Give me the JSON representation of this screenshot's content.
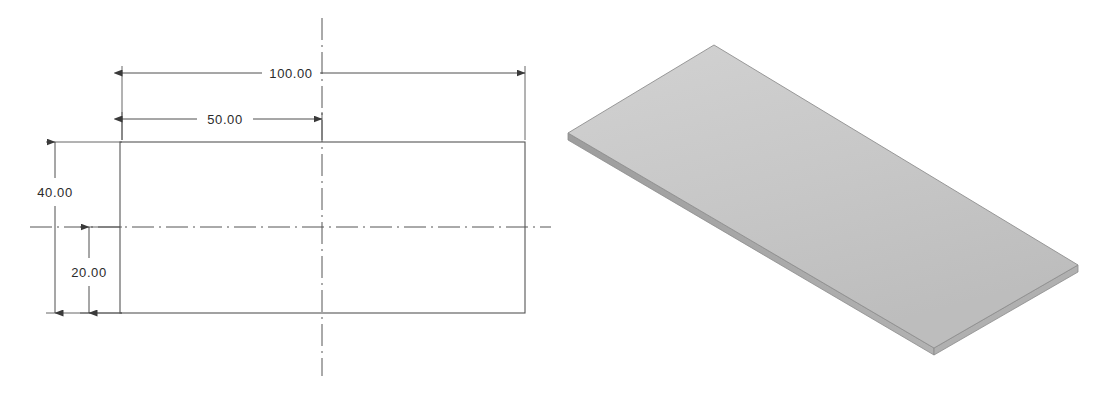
{
  "drawing": {
    "type": "engineering-drawing",
    "style": "solidworks-2d-orthographic-with-isometric",
    "background_color": "#ffffff",
    "line_color": "#4a4a4a",
    "text_color": "#2b2b2b"
  },
  "views": {
    "front_view": {
      "name": "front-view",
      "shape": "rectangle",
      "outline": {
        "x": 120,
        "y": 142,
        "width": 405,
        "height": 171
      }
    },
    "isometric_view": {
      "name": "isometric-view",
      "shape": "flat-plate",
      "top_face_color": "#c9c9c9",
      "edge_color": "#8a8a8a",
      "side_face_color": "#a8a8a8"
    }
  },
  "dimensions": [
    {
      "id": "overall-length",
      "label": "100.00",
      "value": 100.0,
      "unit": "mm",
      "orientation": "horizontal",
      "axis": "x"
    },
    {
      "id": "half-length",
      "label": "50.00",
      "value": 50.0,
      "unit": "mm",
      "orientation": "horizontal",
      "axis": "x"
    },
    {
      "id": "overall-height",
      "label": "40.00",
      "value": 40.0,
      "unit": "mm",
      "orientation": "vertical",
      "axis": "y"
    },
    {
      "id": "half-height",
      "label": "20.00",
      "value": 20.0,
      "unit": "mm",
      "orientation": "vertical",
      "axis": "y"
    }
  ],
  "centerlines": {
    "vertical": {
      "name": "vertical-centerline",
      "x": 322
    },
    "horizontal": {
      "name": "horizontal-centerline",
      "y": 227
    }
  }
}
